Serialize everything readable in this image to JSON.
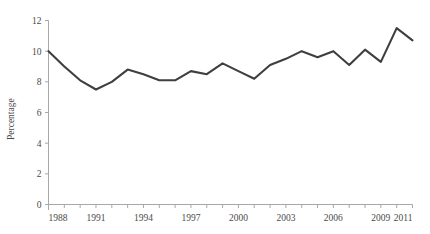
{
  "chart_data": {
    "type": "line",
    "title": "",
    "xlabel": "",
    "ylabel": "Percentage",
    "xlim": [
      1988,
      2011
    ],
    "ylim": [
      0,
      12
    ],
    "grid": false,
    "legend": false,
    "legend_position": "none",
    "line_color": "#3f3f3f",
    "axis_color": "#a8a8a8",
    "y_ticks": [
      0,
      2,
      4,
      6,
      8,
      10,
      12
    ],
    "y_tick_labels": [
      "0",
      "2",
      "4",
      "6",
      "8",
      "10",
      "12"
    ],
    "x_ticks": [
      1988,
      1989,
      1990,
      1991,
      1992,
      1993,
      1994,
      1995,
      1996,
      1997,
      1998,
      1999,
      2000,
      2001,
      2002,
      2003,
      2004,
      2005,
      2006,
      2007,
      2008,
      2009,
      2010,
      2011
    ],
    "x_tick_labels_shown": [
      "1988",
      "1991",
      "1994",
      "1997",
      "2000",
      "2003",
      "2006",
      "2009",
      "2011"
    ],
    "x": [
      1988,
      1989,
      1990,
      1991,
      1992,
      1993,
      1994,
      1995,
      1996,
      1997,
      1998,
      1999,
      2000,
      2001,
      2002,
      2003,
      2004,
      2005,
      2006,
      2007,
      2008,
      2009,
      2010,
      2011
    ],
    "values": [
      10.0,
      9.0,
      8.1,
      7.5,
      8.0,
      8.8,
      8.5,
      8.1,
      8.1,
      8.7,
      8.5,
      9.2,
      8.7,
      8.2,
      9.1,
      9.5,
      10.0,
      9.6,
      10.0,
      9.1,
      10.1,
      9.3,
      11.5,
      10.7
    ],
    "series": [
      {
        "name": "Percentage",
        "values": [
          10.0,
          9.0,
          8.1,
          7.5,
          8.0,
          8.8,
          8.5,
          8.1,
          8.1,
          8.7,
          8.5,
          9.2,
          8.7,
          8.2,
          9.1,
          9.5,
          10.0,
          9.6,
          10.0,
          9.1,
          10.1,
          9.3,
          11.5,
          10.7
        ]
      }
    ]
  }
}
